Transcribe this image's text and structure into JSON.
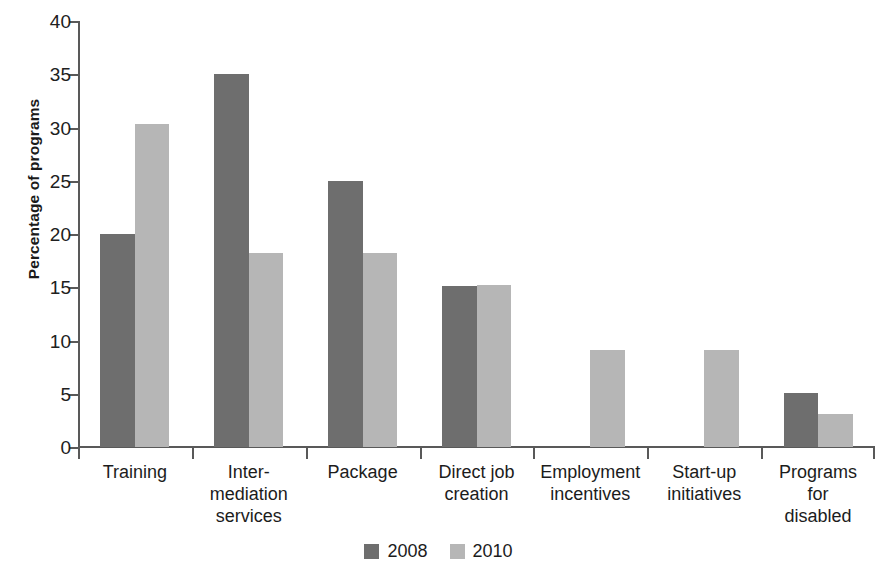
{
  "chart_data": {
    "type": "bar",
    "title": "",
    "xlabel": "",
    "ylabel": "Percentage of programs",
    "ylim": [
      0,
      40
    ],
    "yticks": [
      "0",
      "5",
      "10",
      "15",
      "20",
      "25",
      "30",
      "35",
      "40"
    ],
    "grid": false,
    "legend_position": "bottom-center",
    "categories": [
      "Training",
      "Inter-\nmediation\nservices",
      "Package",
      "Direct job\ncreation",
      "Employment\nincentives",
      "Start-up\ninitiatives",
      "Programs\nfor\ndisabled"
    ],
    "series": [
      {
        "name": "2008",
        "color": "#6e6e6e",
        "values": [
          20.0,
          35.0,
          25.0,
          15.1,
          null,
          null,
          5.1
        ]
      },
      {
        "name": "2010",
        "color": "#b6b6b6",
        "values": [
          30.3,
          18.2,
          18.2,
          15.2,
          9.1,
          9.1,
          3.1
        ]
      }
    ]
  },
  "axis": {
    "y_title": "Percentage of programs"
  },
  "legend": {
    "items": [
      {
        "label": "2008",
        "color": "#6e6e6e"
      },
      {
        "label": "2010",
        "color": "#b6b6b6"
      }
    ]
  }
}
